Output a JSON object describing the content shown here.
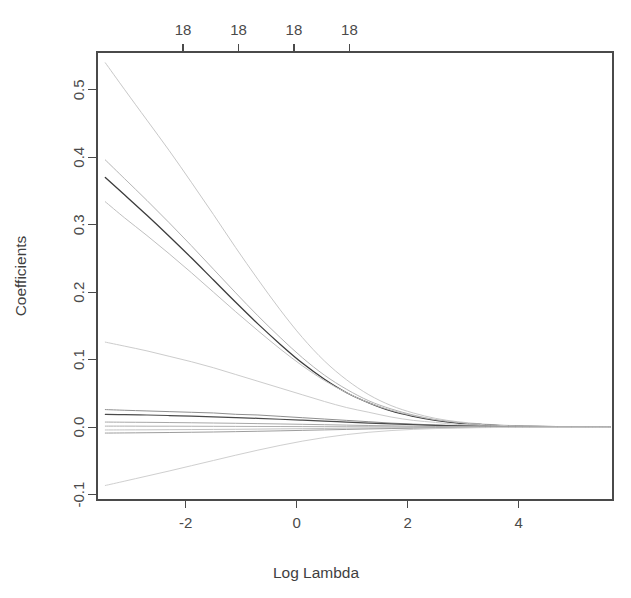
{
  "chart_data": {
    "type": "line",
    "title": "",
    "xlabel": "Log Lambda",
    "ylabel": "Coefficients",
    "xlim": [
      -3.6,
      5.7
    ],
    "ylim": [
      -0.108,
      0.556
    ],
    "grid": false,
    "legend": null,
    "x_ticks": [
      -2,
      0,
      2,
      4
    ],
    "x_tick_labels": [
      "-2",
      "0",
      "2",
      "4"
    ],
    "y_ticks": [
      -0.1,
      0.0,
      0.1,
      0.2,
      0.3,
      0.4,
      0.5
    ],
    "y_tick_labels": [
      "-0.1",
      "0.0",
      "0.1",
      "0.2",
      "0.3",
      "0.4",
      "0.5"
    ],
    "top_axis": {
      "label": "number of nonzero coefficients",
      "ticks": [
        -2.05,
        -1.05,
        -0.05,
        0.95
      ],
      "tick_labels": [
        "18",
        "18",
        "18",
        "18"
      ]
    },
    "x": [
      -3.45,
      -3.1,
      -2.7,
      -2.3,
      -1.9,
      -1.5,
      -1.1,
      -0.7,
      -0.3,
      0.1,
      0.5,
      0.9,
      1.3,
      1.7,
      2.1,
      2.5,
      2.9,
      3.3,
      3.7,
      4.2,
      4.7,
      5.2,
      5.65
    ],
    "series": [
      {
        "name": "coef-1",
        "color": "#c8c8c8",
        "width": 1.0,
        "values": [
          0.54,
          0.5,
          0.455,
          0.41,
          0.363,
          0.315,
          0.266,
          0.219,
          0.174,
          0.133,
          0.098,
          0.07,
          0.048,
          0.032,
          0.021,
          0.013,
          0.008,
          0.005,
          0.003,
          0.0015,
          0.0008,
          0.0004,
          0.0002
        ]
      },
      {
        "name": "coef-2",
        "color": "#b5b5b5",
        "width": 1.0,
        "values": [
          0.396,
          0.368,
          0.336,
          0.303,
          0.269,
          0.234,
          0.199,
          0.165,
          0.133,
          0.103,
          0.077,
          0.056,
          0.039,
          0.027,
          0.018,
          0.011,
          0.007,
          0.004,
          0.0025,
          0.0013,
          0.0007,
          0.0003,
          0.0002
        ]
      },
      {
        "name": "coef-3-main",
        "color": "#3c3c3c",
        "width": 1.3,
        "values": [
          0.37,
          0.344,
          0.314,
          0.283,
          0.251,
          0.218,
          0.185,
          0.153,
          0.123,
          0.095,
          0.071,
          0.051,
          0.036,
          0.024,
          0.016,
          0.01,
          0.006,
          0.004,
          0.002,
          0.0011,
          0.0006,
          0.0003,
          0.0001
        ]
      },
      {
        "name": "coef-4",
        "color": "#bfbfbf",
        "width": 1.0,
        "values": [
          0.334,
          0.31,
          0.284,
          0.257,
          0.229,
          0.2,
          0.171,
          0.143,
          0.116,
          0.091,
          0.069,
          0.051,
          0.036,
          0.025,
          0.017,
          0.011,
          0.007,
          0.004,
          0.0025,
          0.0013,
          0.0007,
          0.0003,
          0.0002
        ]
      },
      {
        "name": "coef-5",
        "color": "#cccccc",
        "width": 1.0,
        "values": [
          0.126,
          0.12,
          0.113,
          0.105,
          0.097,
          0.088,
          0.078,
          0.068,
          0.058,
          0.048,
          0.038,
          0.029,
          0.022,
          0.015,
          0.01,
          0.007,
          0.004,
          0.003,
          0.0015,
          0.0008,
          0.0004,
          0.0002,
          0.0001
        ]
      },
      {
        "name": "coef-6",
        "color": "#8f8f8f",
        "width": 1.0,
        "values": [
          0.026,
          0.025,
          0.024,
          0.023,
          0.022,
          0.021,
          0.019,
          0.018,
          0.016,
          0.014,
          0.012,
          0.01,
          0.008,
          0.006,
          0.0045,
          0.0032,
          0.0022,
          0.0015,
          0.0009,
          0.0005,
          0.0002,
          0.0001,
          5e-05
        ]
      },
      {
        "name": "coef-7",
        "color": "#4a4a4a",
        "width": 1.2,
        "values": [
          0.019,
          0.0185,
          0.018,
          0.0172,
          0.0163,
          0.0153,
          0.0142,
          0.013,
          0.0117,
          0.0103,
          0.0089,
          0.0074,
          0.006,
          0.0047,
          0.0036,
          0.0026,
          0.0018,
          0.0012,
          0.0008,
          0.0004,
          0.0002,
          0.0001,
          4e-05
        ]
      },
      {
        "name": "coef-8",
        "color": "#a8a8a8",
        "width": 1.0,
        "values": [
          0.0075,
          0.0073,
          0.0071,
          0.0068,
          0.0065,
          0.0061,
          0.0057,
          0.0052,
          0.0047,
          0.0042,
          0.0036,
          0.003,
          0.0024,
          0.0019,
          0.0014,
          0.001,
          0.0007,
          0.0005,
          0.0003,
          0.00015,
          8e-05,
          4e-05,
          2e-05
        ]
      },
      {
        "name": "coef-9",
        "color": "#b0b0b0",
        "width": 1.0,
        "values": [
          0.0015,
          0.0015,
          0.0014,
          0.0014,
          0.0013,
          0.0012,
          0.0011,
          0.001,
          0.0009,
          0.0008,
          0.0007,
          0.0006,
          0.0005,
          0.0004,
          0.0003,
          0.0002,
          0.00015,
          0.0001,
          6e-05,
          3e-05,
          2e-05,
          1e-05,
          5e-06
        ]
      },
      {
        "name": "coef-10",
        "color": "#c2c2c2",
        "width": 1.0,
        "values": [
          -0.0042,
          -0.0041,
          -0.004,
          -0.0038,
          -0.0036,
          -0.0034,
          -0.0032,
          -0.0029,
          -0.0026,
          -0.0023,
          -0.002,
          -0.0016,
          -0.0013,
          -0.001,
          -0.0008,
          -0.0006,
          -0.0004,
          -0.0003,
          -0.0002,
          -0.0001,
          -5e-05,
          -2e-05,
          -1e-05
        ]
      },
      {
        "name": "coef-11",
        "color": "#9d9d9d",
        "width": 1.0,
        "values": [
          -0.0088,
          -0.0086,
          -0.0083,
          -0.008,
          -0.0076,
          -0.0072,
          -0.0067,
          -0.0061,
          -0.0055,
          -0.0048,
          -0.0041,
          -0.0034,
          -0.0027,
          -0.0021,
          -0.0016,
          -0.0012,
          -0.0008,
          -0.0005,
          -0.0003,
          -0.00015,
          -8e-05,
          -4e-05,
          -2e-05
        ]
      },
      {
        "name": "coef-12",
        "color": "#cfcfcf",
        "width": 1.0,
        "values": [
          -0.0865,
          -0.08,
          -0.0725,
          -0.065,
          -0.0572,
          -0.0494,
          -0.0416,
          -0.0341,
          -0.0271,
          -0.0208,
          -0.0154,
          -0.011,
          -0.0076,
          -0.0051,
          -0.0033,
          -0.0021,
          -0.0013,
          -0.0008,
          -0.0005,
          -0.00025,
          -0.00012,
          -6e-05,
          -3e-05
        ]
      }
    ]
  },
  "geometry": {
    "frame_left": 97,
    "frame_right": 613,
    "frame_top": 52,
    "frame_bottom": 500
  },
  "labels": {
    "y_axis_title": "Coefficients",
    "x_axis_title": "Log Lambda"
  }
}
